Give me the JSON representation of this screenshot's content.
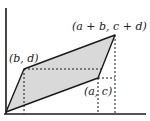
{
  "diagram": {
    "type": "parallelogram-area",
    "labels": {
      "sum_point": "(a + b, c + d)",
      "b_point": "(b, d)",
      "a_point": "(a, c)"
    },
    "points": {
      "origin": [
        6,
        112
      ],
      "b_point": [
        24,
        69
      ],
      "a_point": [
        98,
        78
      ],
      "sum_point": [
        115,
        35
      ]
    },
    "colors": {
      "fill": "#d9d9d9",
      "stroke": "#1a1a1a",
      "background": "#ffffff"
    }
  }
}
